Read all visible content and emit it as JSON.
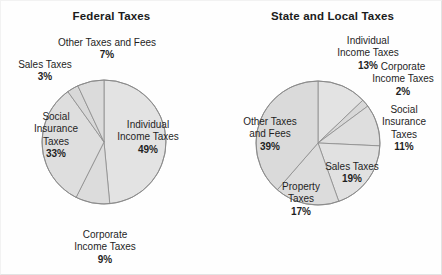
{
  "figure": {
    "background_color": "#fefefe",
    "border_color": "#e3e3e3"
  },
  "charts": [
    {
      "id": "federal-taxes",
      "title": "Federal Taxes",
      "slices": [
        {
          "name": "Individual Income Taxes",
          "label_line1": "Individual",
          "label_line2": "Income Taxes",
          "percent_text": "49%",
          "value": 49,
          "color": "#e3e3e3"
        },
        {
          "name": "Corporate Income Taxes",
          "label_line1": "Corporate",
          "label_line2": "Income Taxes",
          "percent_text": "9%",
          "value": 9,
          "color": "#dcdcdc"
        },
        {
          "name": "Social Insurance Taxes",
          "label_line1": "Social",
          "label_line2": "Insurance",
          "label_line3": "Taxes",
          "percent_text": "33%",
          "value": 33,
          "color": "#dedede"
        },
        {
          "name": "Sales Taxes",
          "label_line1": "Sales Taxes",
          "percent_text": "3%",
          "value": 3,
          "color": "#d8d8d8"
        },
        {
          "name": "Other Taxes and Fees",
          "label_line1": "Other Taxes and Fees",
          "percent_text": "7%",
          "value": 7,
          "color": "#dbdbdb"
        }
      ]
    },
    {
      "id": "state-and-local-taxes",
      "title": "State and Local Taxes",
      "slices": [
        {
          "name": "Individual Income Taxes",
          "label_line1": "Individual",
          "label_line2": "Income Taxes",
          "percent_text": "13%",
          "value": 13,
          "color": "#e3e3e3"
        },
        {
          "name": "Corporate Income Taxes",
          "label_line1": "Corporate",
          "label_line2": "Income Taxes",
          "percent_text": "2%",
          "value": 2,
          "color": "#d8d8d8"
        },
        {
          "name": "Social Insurance Taxes",
          "label_line1": "Social",
          "label_line2": "Insurance",
          "label_line3": "Taxes",
          "percent_text": "11%",
          "value": 11,
          "color": "#dedede"
        },
        {
          "name": "Sales Taxes",
          "label_line1": "Sales Taxes",
          "percent_text": "19%",
          "value": 19,
          "color": "#e1e1e1"
        },
        {
          "name": "Property Taxes",
          "label_line1": "Property",
          "label_line2": "Taxes",
          "percent_text": "17%",
          "value": 17,
          "color": "#dcdcdc"
        },
        {
          "name": "Other Taxes and Fees",
          "label_line1": "Other Taxes",
          "label_line2": "and Fees",
          "percent_text": "39%",
          "value": 39,
          "color": "#dadada"
        }
      ]
    }
  ],
  "chart_data": [
    {
      "type": "pie",
      "title": "Federal Taxes",
      "xlabel": "",
      "ylabel": "",
      "legend": "none",
      "labels": [
        "Individual Income Taxes",
        "Corporate Income Taxes",
        "Social Insurance Taxes",
        "Sales Taxes",
        "Other Taxes and Fees"
      ],
      "values": [
        49,
        9,
        33,
        3,
        7
      ],
      "units": "percent",
      "start_angle_deg": 90,
      "direction": "clockwise",
      "annotations": [
        "49%",
        "9%",
        "33%",
        "3%",
        "7%"
      ]
    },
    {
      "type": "pie",
      "title": "State and Local Taxes",
      "xlabel": "",
      "ylabel": "",
      "legend": "none",
      "labels": [
        "Individual Income Taxes",
        "Corporate Income Taxes",
        "Social Insurance Taxes",
        "Sales Taxes",
        "Property Taxes",
        "Other Taxes and Fees"
      ],
      "values": [
        13,
        2,
        11,
        19,
        17,
        39
      ],
      "units": "percent",
      "start_angle_deg": 90,
      "direction": "clockwise",
      "annotations": [
        "13%",
        "2%",
        "11%",
        "19%",
        "17%",
        "39%"
      ]
    }
  ]
}
